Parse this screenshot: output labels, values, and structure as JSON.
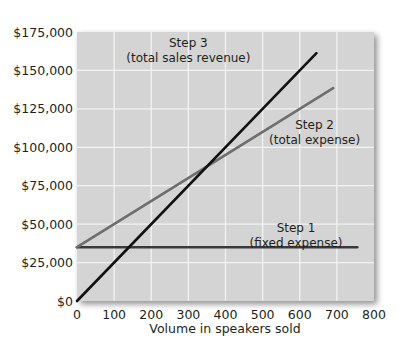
{
  "chart_data": {
    "type": "line",
    "title": "",
    "xlabel": "Volume in speakers sold",
    "ylabel": "",
    "xlim": [
      0,
      800
    ],
    "ylim": [
      0,
      175000
    ],
    "grid": true,
    "legend": "none (inline annotations)",
    "x_ticks": [
      "0",
      "100",
      "200",
      "300",
      "400",
      "500",
      "600",
      "700",
      "800"
    ],
    "y_ticks": [
      "$0",
      "$25,000",
      "$50,000",
      "$75,000",
      "$100,000",
      "$125,000",
      "$150,000",
      "$175,000"
    ],
    "series": [
      {
        "name": "Step 1 (fixed expense)",
        "color": "#3a3a3a",
        "x": [
          0,
          755
        ],
        "values": [
          35000,
          35000
        ]
      },
      {
        "name": "Step 2 (total expense)",
        "color": "#6e6e6e",
        "x": [
          0,
          690
        ],
        "values": [
          35000,
          138500
        ]
      },
      {
        "name": "Step 3 (total sales revenue)",
        "color": "#111111",
        "x": [
          0,
          645
        ],
        "values": [
          0,
          161250
        ]
      }
    ],
    "annotations": [
      {
        "line1": "Step 3",
        "line2": "(total sales revenue)",
        "x": 300,
        "y": 165000
      },
      {
        "line1": "Step 2",
        "line2": "(total expense)",
        "x": 640,
        "y": 112000
      },
      {
        "line1": "Step 1",
        "line2": "(fixed expense)",
        "x": 590,
        "y": 45000
      }
    ],
    "breakeven": {
      "units": 350,
      "revenue": 87500
    }
  },
  "colors": {
    "plot_bg": "#d4d4d4",
    "grid": "#f2f2f2",
    "shadow": "#9a9a9a"
  }
}
